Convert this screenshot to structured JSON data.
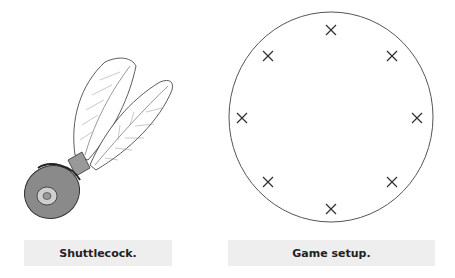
{
  "figures": [
    {
      "id": "shuttlecock",
      "caption": "Shuttlecock."
    },
    {
      "id": "game-setup",
      "caption": "Game setup.",
      "circle": {
        "cx": 331,
        "cy": 117,
        "rx": 102,
        "ry": 105
      },
      "markers": [
        {
          "x": 331,
          "y": 30
        },
        {
          "x": 392,
          "y": 56
        },
        {
          "x": 417,
          "y": 118
        },
        {
          "x": 392,
          "y": 182
        },
        {
          "x": 331,
          "y": 209
        },
        {
          "x": 268,
          "y": 182
        },
        {
          "x": 242,
          "y": 118
        },
        {
          "x": 268,
          "y": 56
        }
      ],
      "marker_symbol": "×"
    }
  ],
  "colors": {
    "stroke": "#333333",
    "caption_bg": "#eeeeee",
    "cork": "#8a8a8a",
    "cork_inner": "#cfcfcf"
  }
}
